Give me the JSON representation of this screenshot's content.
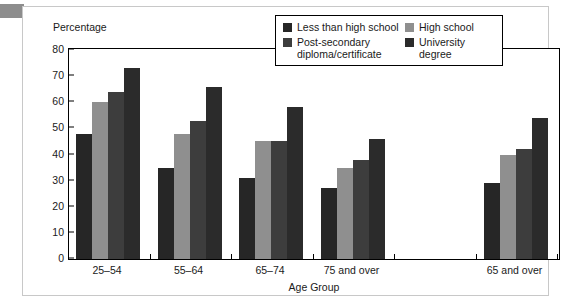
{
  "figure": {
    "y_axis_title": "Percentage",
    "x_axis_title": "Age Group"
  },
  "legend": {
    "entries": [
      {
        "label": "Less than high school",
        "color": "#262626"
      },
      {
        "label": "High school",
        "color": "#8f8f8f"
      },
      {
        "label": "Post-secondary\ndiploma/certificate",
        "color": "#3d3d3d"
      },
      {
        "label": "University degree",
        "color": "#2b2b2b"
      }
    ]
  },
  "chart_data": {
    "type": "bar",
    "title": "",
    "subtitle": "",
    "xlabel": "Age Group",
    "ylabel": "Percentage",
    "ylim": [
      0,
      80
    ],
    "ytick_labels": [
      "0",
      "10",
      "20",
      "30",
      "40",
      "50",
      "60",
      "70",
      "80"
    ],
    "yticks": [
      0,
      10,
      20,
      30,
      40,
      50,
      60,
      70,
      80
    ],
    "grid": false,
    "legend_position": "top-right-inside",
    "categories": [
      "25–54",
      "55–64",
      "65–74",
      "75 and over",
      "",
      "65 and over"
    ],
    "series": [
      {
        "name": "Less than high school",
        "color": "#262626",
        "values": [
          48,
          35,
          31,
          27,
          null,
          29
        ]
      },
      {
        "name": "High school",
        "color": "#8f8f8f",
        "values": [
          60,
          48,
          45,
          35,
          null,
          40
        ]
      },
      {
        "name": "Post-secondary diploma/certificate",
        "color": "#3d3d3d",
        "values": [
          64,
          53,
          45,
          38,
          null,
          42
        ]
      },
      {
        "name": "University degree",
        "color": "#2b2b2b",
        "values": [
          73,
          66,
          58,
          46,
          null,
          54
        ]
      }
    ]
  }
}
